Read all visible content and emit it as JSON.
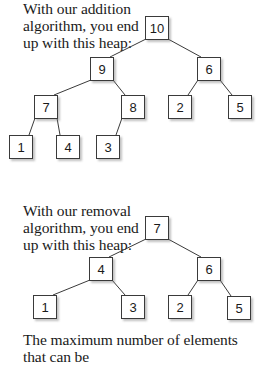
{
  "items": [
    {
      "number": "4.",
      "lines": [
        "With our addition",
        "algorithm, you end",
        "up with this heap:"
      ]
    },
    {
      "number": "5.",
      "lines": [
        "With our removal",
        "algorithm, you end",
        "up with this heap:"
      ]
    },
    {
      "number": "6.",
      "lines": [
        "The maximum number of elements that can be"
      ]
    }
  ],
  "heaps": [
    {
      "name": "addition-heap",
      "nodes": [
        {
          "id": "a10",
          "value": "10",
          "x": 145,
          "y": 16
        },
        {
          "id": "a9",
          "value": "9",
          "x": 90,
          "y": 57
        },
        {
          "id": "a6",
          "value": "6",
          "x": 197,
          "y": 57
        },
        {
          "id": "a7",
          "value": "7",
          "x": 34,
          "y": 95
        },
        {
          "id": "a8",
          "value": "8",
          "x": 121,
          "y": 95
        },
        {
          "id": "a2",
          "value": "2",
          "x": 168,
          "y": 95
        },
        {
          "id": "a5",
          "value": "5",
          "x": 228,
          "y": 95
        },
        {
          "id": "a1",
          "value": "1",
          "x": 9,
          "y": 135
        },
        {
          "id": "a4",
          "value": "4",
          "x": 56,
          "y": 135
        },
        {
          "id": "a3",
          "value": "3",
          "x": 96,
          "y": 135
        }
      ],
      "edges": [
        [
          "a10",
          "a9"
        ],
        [
          "a10",
          "a6"
        ],
        [
          "a9",
          "a7"
        ],
        [
          "a9",
          "a8"
        ],
        [
          "a6",
          "a2"
        ],
        [
          "a6",
          "a5"
        ],
        [
          "a7",
          "a1"
        ],
        [
          "a7",
          "a4"
        ],
        [
          "a8",
          "a3"
        ]
      ]
    },
    {
      "name": "removal-heap",
      "nodes": [
        {
          "id": "b7",
          "value": "7",
          "x": 145,
          "y": 216
        },
        {
          "id": "b4",
          "value": "4",
          "x": 89,
          "y": 257
        },
        {
          "id": "b6",
          "value": "6",
          "x": 197,
          "y": 257
        },
        {
          "id": "b1",
          "value": "1",
          "x": 33,
          "y": 295
        },
        {
          "id": "b3",
          "value": "3",
          "x": 121,
          "y": 295
        },
        {
          "id": "b2",
          "value": "2",
          "x": 168,
          "y": 295
        },
        {
          "id": "b5",
          "value": "5",
          "x": 227,
          "y": 296
        }
      ],
      "edges": [
        [
          "b7",
          "b4"
        ],
        [
          "b7",
          "b6"
        ],
        [
          "b4",
          "b1"
        ],
        [
          "b4",
          "b3"
        ],
        [
          "b6",
          "b2"
        ],
        [
          "b6",
          "b5"
        ]
      ]
    }
  ],
  "colors": {
    "edge": "#3a3a3a",
    "border": "#3a3a3a",
    "text": "#1a1a1a"
  }
}
